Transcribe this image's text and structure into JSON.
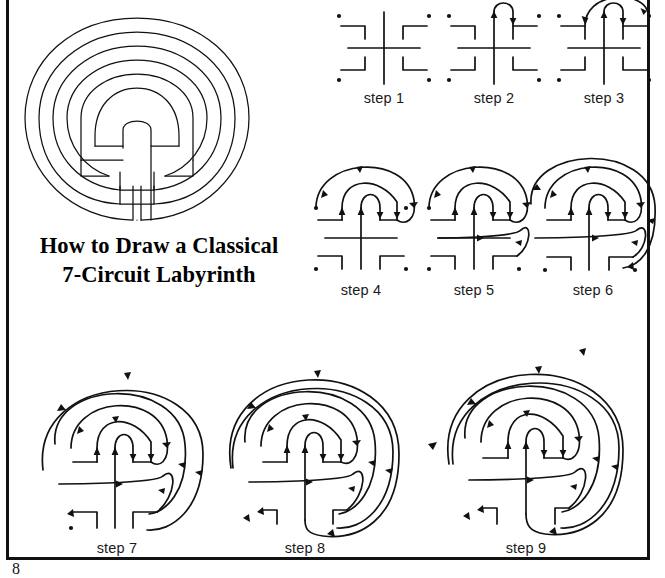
{
  "document": {
    "page_number": "8",
    "title_lines": [
      "How to Draw a Classical",
      "7-Circuit Labyrinth"
    ],
    "border_color": "#111111",
    "ink_color": "#111111",
    "background_color": "#ffffff"
  },
  "figures": {
    "main_labyrinth": {
      "name": "classical-7-circuit-labyrinth",
      "circuits": 7,
      "description": "Completed classical seven-circuit Cretan labyrinth drawn with a single continuous path"
    },
    "steps": [
      {
        "id": "step1",
        "label": "step 1",
        "seed": "cross-angles-dots",
        "elements": [
          "vertical-bar",
          "horizontal-bar",
          "four-corner-angles",
          "four-corner-dots"
        ],
        "arcs": 0
      },
      {
        "id": "step2",
        "label": "step 2",
        "seed": "cross-angles-dots",
        "arcs": 1,
        "arc_note": "Arc from top of cross to top of upper-right angle"
      },
      {
        "id": "step3",
        "label": "step 3",
        "seed": "cross-angles-dots",
        "arcs": 2,
        "arc_note": "Second arc from top of upper-left angle to upper-right dot"
      },
      {
        "id": "step4",
        "label": "step 4",
        "seed": "cross-angles-dots",
        "arcs": 3,
        "arc_note": "Third arc from upper-left dot to right arm of horizontal bar"
      },
      {
        "id": "step5",
        "label": "step 5",
        "seed": "cross-angles-dots",
        "arcs": 4,
        "arc_note": "Fourth arc from left arm of horizontal bar to top of lower-right angle"
      },
      {
        "id": "step6",
        "label": "step 6",
        "seed": "cross-angles-dots",
        "arcs": 5,
        "arc_note": "Fifth arc from top of lower-left angle to end of lower-right angle"
      },
      {
        "id": "step7",
        "label": "step 7",
        "seed": "cross-angles-dots",
        "arcs": 6,
        "arc_note": "Sixth arc from end of lower-left angle to lower-right dot"
      },
      {
        "id": "step8",
        "label": "step 8",
        "seed": "cross-angles-dots",
        "arcs": 7,
        "arc_note": "Seventh arc from lower-left dot to bottom of cross — labyrinth closed"
      },
      {
        "id": "step9",
        "label": "step 9",
        "seed": "cross-angles-dots",
        "arcs": 7,
        "arc_note": "Finished seven-circuit labyrinth with path direction arrows"
      }
    ]
  }
}
